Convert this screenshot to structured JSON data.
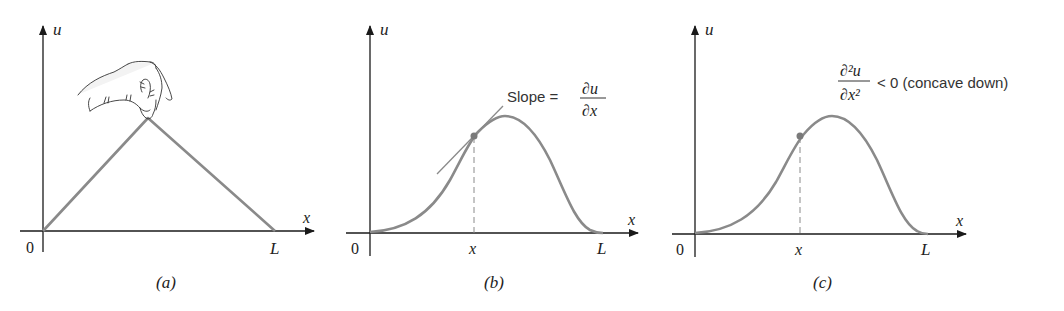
{
  "colors": {
    "axis": "#1a1a1a",
    "curve": "#8a8a8a",
    "point": "#7a7a7a",
    "text": "#222222"
  },
  "panels": [
    {
      "id": "a",
      "caption": "(a)",
      "axis_x_label": "x",
      "axis_y_label": "u",
      "origin_label": "0",
      "end_label": "L",
      "shape": "triangle (string plucked by hand at one point)"
    },
    {
      "id": "b",
      "caption": "(b)",
      "axis_x_label": "x",
      "axis_y_label": "u",
      "origin_label": "0",
      "end_label": "L",
      "point_label": "x",
      "annotation": {
        "prefix": "Slope =",
        "numerator": "∂u",
        "denominator": "∂x"
      }
    },
    {
      "id": "c",
      "caption": "(c)",
      "axis_x_label": "x",
      "axis_y_label": "u",
      "origin_label": "0",
      "end_label": "L",
      "point_label": "x",
      "annotation": {
        "numerator": "∂²u",
        "denominator": "∂x²",
        "suffix": "< 0 (concave down)"
      }
    }
  ]
}
